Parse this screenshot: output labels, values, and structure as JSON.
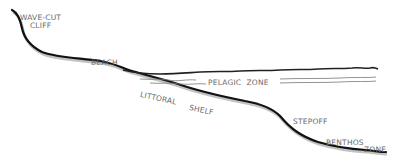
{
  "diagram": {
    "type": "coastal-profile-cross-section",
    "labels": {
      "wave_cut_cliff_line1": "WAVE-CUT",
      "wave_cut_cliff_line2": "CLIFF",
      "beach": "BEACH",
      "pelagic_zone": "PELAGIC  ZONE",
      "littoral": "LITTORAL",
      "shelf": "SHELF",
      "stepoff": "STEPOFF",
      "benthos": "BENTHOS",
      "zone": "ZONE"
    },
    "colors": {
      "shoreline": "#111111",
      "shading": "#9a9a9a",
      "water_surface": "#222222",
      "water_lines": "#777777",
      "label_text": "#6a6a6a",
      "background": "#ffffff"
    }
  }
}
